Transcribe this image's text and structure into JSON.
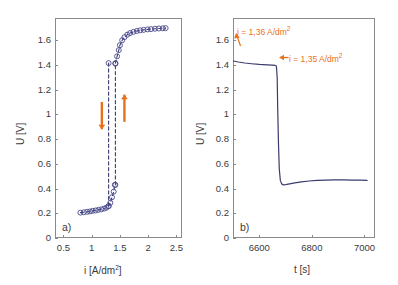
{
  "figure": {
    "panels": [
      "a",
      "b"
    ],
    "background": "#ffffff",
    "axis_color": "#8a8a8a",
    "curve_color": "#3b3b6e",
    "marker_color": "#4a4a8c",
    "annotation_color": "#e8701a"
  },
  "chart_data": [
    {
      "type": "scatter",
      "panel_tag": "a)",
      "title": "",
      "xlabel": "i [A/dm2]",
      "xlabel_base": "i [A/dm",
      "xlabel_sup": "2",
      "xlabel_tail": "]",
      "ylabel": "U [V]",
      "xlim": [
        0.35,
        2.6
      ],
      "ylim": [
        0,
        1.78
      ],
      "xticks": [
        0.5,
        1,
        1.5,
        2,
        2.5
      ],
      "xtick_labels": [
        "0.5",
        "1",
        "1.5",
        "2",
        "2.5"
      ],
      "yticks": [
        0,
        0.2,
        0.4,
        0.6,
        0.8,
        1,
        1.2,
        1.4,
        1.6
      ],
      "ytick_labels": [
        "0",
        "0.2",
        "0.4",
        "0.6",
        "0.8",
        "1",
        "1.2",
        "1.4",
        "1.6"
      ],
      "grid": false,
      "legend": "none",
      "series": [
        {
          "name": "lower branch (increasing i)",
          "marker": "circle",
          "linestyle": "dashed",
          "points": [
            [
              0.8,
              0.205
            ],
            [
              0.86,
              0.208
            ],
            [
              0.92,
              0.212
            ],
            [
              0.97,
              0.215
            ],
            [
              1.02,
              0.22
            ],
            [
              1.07,
              0.223
            ],
            [
              1.12,
              0.228
            ],
            [
              1.17,
              0.232
            ],
            [
              1.22,
              0.238
            ],
            [
              1.26,
              0.245
            ],
            [
              1.3,
              0.258
            ],
            [
              1.33,
              0.285
            ],
            [
              1.36,
              0.33
            ],
            [
              1.39,
              0.375
            ],
            [
              1.41,
              0.43
            ]
          ]
        },
        {
          "name": "rising transition (up jump)",
          "marker": "circle",
          "linestyle": "dashed",
          "points": [
            [
              1.42,
              0.43
            ],
            [
              1.42,
              1.41
            ]
          ]
        },
        {
          "name": "upper branch (decreasing i)",
          "marker": "circle",
          "linestyle": "dashed",
          "points": [
            [
              1.42,
              1.415
            ],
            [
              1.45,
              1.47
            ],
            [
              1.48,
              1.52
            ],
            [
              1.5,
              1.56
            ],
            [
              1.54,
              1.6
            ],
            [
              1.58,
              1.625
            ],
            [
              1.63,
              1.645
            ],
            [
              1.68,
              1.658
            ],
            [
              1.74,
              1.668
            ],
            [
              1.8,
              1.675
            ],
            [
              1.86,
              1.68
            ],
            [
              1.92,
              1.684
            ],
            [
              1.99,
              1.688
            ],
            [
              2.05,
              1.69
            ],
            [
              2.12,
              1.693
            ],
            [
              2.19,
              1.695
            ],
            [
              2.26,
              1.697
            ],
            [
              2.31,
              1.698
            ]
          ]
        },
        {
          "name": "falling transition (down jump)",
          "marker": "circle",
          "linestyle": "dashed",
          "points": [
            [
              1.3,
              1.415
            ],
            [
              1.3,
              0.258
            ]
          ]
        }
      ],
      "annotations": [
        {
          "name": "down-arrow",
          "direction": "down",
          "x": 1.18,
          "y_from": 1.1,
          "y_to": 0.88
        },
        {
          "name": "up-arrow",
          "direction": "up",
          "x": 1.58,
          "y_from": 0.94,
          "y_to": 1.16
        }
      ]
    },
    {
      "type": "line",
      "panel_tag": "b)",
      "title": "",
      "xlabel": "t [s]",
      "ylabel": "U [V]",
      "xlim": [
        6500,
        7040
      ],
      "ylim": [
        0,
        1.78
      ],
      "xticks": [
        6600,
        6800,
        7000
      ],
      "xtick_labels": [
        "6600",
        "6800",
        "7000"
      ],
      "yticks": [
        0,
        0.2,
        0.4,
        0.6,
        0.8,
        1,
        1.2,
        1.4,
        1.6
      ],
      "ytick_labels": [
        "0",
        "0.2",
        "0.4",
        "0.6",
        "0.8",
        "1",
        "1.2",
        "1.4",
        "1.6"
      ],
      "grid": false,
      "legend": "none",
      "series": [
        {
          "name": "cell voltage vs time",
          "marker": "none",
          "linestyle": "solid",
          "points": [
            [
              6502,
              1.432
            ],
            [
              6520,
              1.424
            ],
            [
              6545,
              1.416
            ],
            [
              6570,
              1.41
            ],
            [
              6600,
              1.404
            ],
            [
              6630,
              1.4
            ],
            [
              6650,
              1.398
            ],
            [
              6660,
              1.396
            ],
            [
              6665,
              1.392
            ],
            [
              6668,
              1.3
            ],
            [
              6670,
              1.05
            ],
            [
              6673,
              0.76
            ],
            [
              6676,
              0.56
            ],
            [
              6680,
              0.466
            ],
            [
              6685,
              0.438
            ],
            [
              6692,
              0.43
            ],
            [
              6700,
              0.432
            ],
            [
              6715,
              0.438
            ],
            [
              6735,
              0.446
            ],
            [
              6760,
              0.454
            ],
            [
              6790,
              0.461
            ],
            [
              6820,
              0.466
            ],
            [
              6850,
              0.469
            ],
            [
              6885,
              0.47
            ],
            [
              6920,
              0.47
            ],
            [
              6955,
              0.469
            ],
            [
              6985,
              0.468
            ],
            [
              7010,
              0.467
            ]
          ]
        }
      ],
      "annotations": [
        {
          "name": "annotation-upper-current",
          "text_base": "i = 1,36 A/dm",
          "text_sup": "2",
          "has_leader_line": true,
          "arrow": "none"
        },
        {
          "name": "annotation-lower-current",
          "text_base": "i = 1,35 A/dm",
          "text_sup": "2",
          "has_leader_line": false,
          "arrow": "left"
        }
      ]
    }
  ]
}
